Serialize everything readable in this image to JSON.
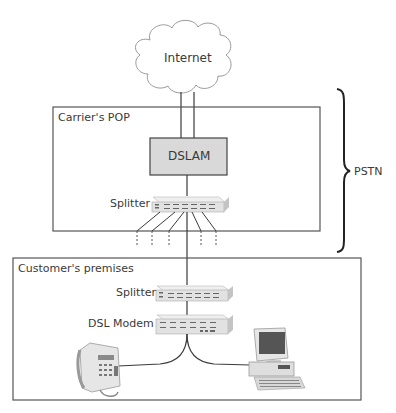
{
  "diagram": {
    "cloud": {
      "label": "Internet"
    },
    "carrier_pop": {
      "label": "Carrier's POP",
      "dslam": {
        "label": "DSLAM",
        "fill": "#d9d9d9"
      },
      "splitter": {
        "label": "Splitter"
      }
    },
    "pstn": {
      "label": "PSTN"
    },
    "customer_premises": {
      "label": "Customer's premises",
      "splitter": {
        "label": "Splitter"
      },
      "dsl_modem": {
        "label": "DSL Modem"
      },
      "devices": [
        "telephone",
        "computer"
      ]
    },
    "colors": {
      "line": "#3a3a3a",
      "box_border": "#555555",
      "device_fill": "#e4e4e4",
      "device_shadow": "#b5b5b5"
    }
  }
}
